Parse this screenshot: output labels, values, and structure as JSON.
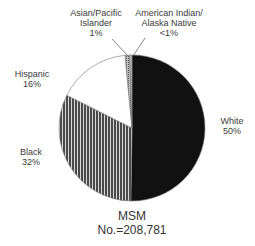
{
  "chart_data": {
    "type": "pie",
    "title": "MSM",
    "subtitle": "No.=208,781",
    "categories": [
      "White",
      "Black",
      "Hispanic",
      "Asian/Pacific Islander",
      "American Indian/Alaska Native"
    ],
    "values": [
      50,
      32,
      16,
      1,
      0.5
    ],
    "value_labels": [
      "50%",
      "32%",
      "16%",
      "1%",
      "<1%"
    ],
    "fills": [
      "solid-black",
      "vertical-stripes-gray",
      "white",
      "dotted-gray",
      "light-gray"
    ],
    "colors": [
      "#111111",
      "#555555",
      "#ffffff",
      "#999999",
      "#bbbbbb"
    ]
  },
  "labels": {
    "white": {
      "name": "White",
      "pct": "50%"
    },
    "black": {
      "name": "Black",
      "pct": "32%"
    },
    "hispanic": {
      "name": "Hispanic",
      "pct": "16%"
    },
    "asian": {
      "name1": "Asian/Pacific",
      "name2": "Islander",
      "pct": "1%"
    },
    "amind": {
      "name1": "American Indian/",
      "name2": "Alaska Native",
      "pct": "<1%"
    }
  },
  "caption": {
    "line1": "MSM",
    "line2": "No.=208,781"
  }
}
